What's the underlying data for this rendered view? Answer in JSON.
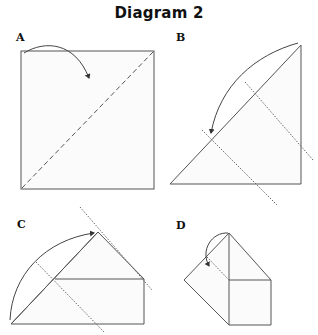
{
  "title": "Diagram 2",
  "panels": [
    {
      "id": "A",
      "label": "A",
      "description": "Square with dashed diagonal fold line; arrow folds top-left corner down"
    },
    {
      "id": "B",
      "label": "B",
      "description": "Triangle (square folded in half diagonally) with two dotted fold lines; arrow folds apex down-left"
    },
    {
      "id": "C",
      "label": "C",
      "description": "Folded shape: triangle over rectangle with dotted fold lines; arrow folds bottom-left point up to apex"
    },
    {
      "id": "D",
      "label": "D",
      "description": "House-like shape: square with triangular top and left flap; dotted line with small arrow fold"
    }
  ],
  "colors": {
    "stroke": "#555555",
    "fill": "#fbfbfb",
    "text": "#111111"
  }
}
